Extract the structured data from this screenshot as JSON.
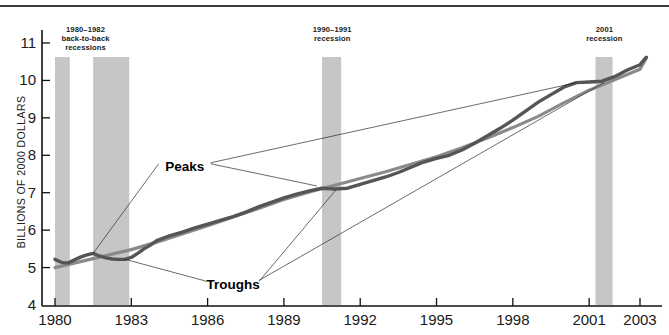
{
  "figure": {
    "ylabel": "BILLIONS OF 2000 DOLLARS"
  },
  "annotations": {
    "peaks": "Peaks",
    "troughs": "Troughs"
  },
  "recession_bands": [
    {
      "id": "r1980",
      "start": 1980.0,
      "end": 1980.58,
      "note_lines": []
    },
    {
      "id": "r1981",
      "start": 1981.5,
      "end": 1982.92,
      "note_lines": [
        "1980–1982",
        "back-to-back",
        "recessions"
      ],
      "note_x": 1981.2
    },
    {
      "id": "r1990",
      "start": 1990.5,
      "end": 1991.25,
      "note_lines": [
        "1990–1991",
        "recession"
      ],
      "note_x": 1990.9
    },
    {
      "id": "r2001",
      "start": 2001.25,
      "end": 2001.92,
      "note_lines": [
        "2001",
        "recession"
      ],
      "note_x": 2001.6
    }
  ],
  "chart_data": {
    "type": "line",
    "title": "",
    "xlabel": "",
    "ylabel": "BILLIONS OF 2000 DOLLARS",
    "xlim": [
      1979.6,
      2003.5
    ],
    "ylim": [
      4,
      11.4
    ],
    "yticks": [
      4,
      5,
      6,
      7,
      8,
      9,
      10,
      11
    ],
    "xticks": [
      1980,
      1983,
      1986,
      1989,
      1992,
      1995,
      1998,
      2001,
      2003
    ],
    "xtick_labels": [
      "1980",
      "1983",
      "1986",
      "1989",
      "1992",
      "1995",
      "1998",
      "2001",
      "2003"
    ],
    "grid": false,
    "legend": "none",
    "series": [
      {
        "name": "Actual GDP",
        "color": "#555555",
        "x": [
          1980.0,
          1980.25,
          1980.5,
          1980.75,
          1981.0,
          1981.25,
          1981.5,
          1981.75,
          1982.0,
          1982.25,
          1982.5,
          1982.75,
          1983.0,
          1983.25,
          1983.5,
          1983.75,
          1984.0,
          1984.5,
          1985.0,
          1985.5,
          1986.0,
          1986.5,
          1987.0,
          1987.5,
          1988.0,
          1988.5,
          1989.0,
          1989.5,
          1990.0,
          1990.5,
          1991.0,
          1991.5,
          1992.0,
          1992.5,
          1993.0,
          1993.5,
          1994.0,
          1994.5,
          1995.0,
          1995.5,
          1996.0,
          1996.5,
          1997.0,
          1997.5,
          1998.0,
          1998.5,
          1999.0,
          1999.5,
          2000.0,
          2000.5,
          2001.0,
          2001.5,
          2002.0,
          2002.5,
          2003.0,
          2003.25
        ],
        "y": [
          5.22,
          5.14,
          5.12,
          5.2,
          5.28,
          5.34,
          5.38,
          5.31,
          5.26,
          5.23,
          5.22,
          5.22,
          5.27,
          5.38,
          5.5,
          5.6,
          5.72,
          5.85,
          5.95,
          6.06,
          6.16,
          6.26,
          6.36,
          6.48,
          6.62,
          6.74,
          6.86,
          6.96,
          7.05,
          7.12,
          7.1,
          7.12,
          7.22,
          7.32,
          7.42,
          7.54,
          7.68,
          7.82,
          7.92,
          8.0,
          8.14,
          8.32,
          8.52,
          8.72,
          8.94,
          9.18,
          9.42,
          9.62,
          9.82,
          9.94,
          9.96,
          9.98,
          10.1,
          10.28,
          10.42,
          10.62
        ],
        "description": "Real GDP, wiggly line"
      },
      {
        "name": "Potential GDP trend",
        "color": "#8a8a8a",
        "x": [
          1980.0,
          1981.0,
          1982.0,
          1983.0,
          1984.0,
          1985.0,
          1986.0,
          1987.0,
          1988.0,
          1989.0,
          1990.0,
          1991.0,
          1992.0,
          1993.0,
          1994.0,
          1995.0,
          1996.0,
          1997.0,
          1998.0,
          1999.0,
          2000.0,
          2001.0,
          2002.0,
          2003.0,
          2003.25
        ],
        "y": [
          5.0,
          5.16,
          5.32,
          5.48,
          5.68,
          5.9,
          6.12,
          6.35,
          6.58,
          6.82,
          7.02,
          7.2,
          7.38,
          7.56,
          7.76,
          7.96,
          8.2,
          8.46,
          8.74,
          9.04,
          9.4,
          9.74,
          10.02,
          10.3,
          10.6
        ],
        "description": "Smoothed potential output"
      }
    ],
    "annotations": [
      {
        "label": "Peaks",
        "x": 1985.1,
        "y": 7.72
      },
      {
        "label": "Troughs",
        "x": 1987.0,
        "y": 4.55
      }
    ]
  }
}
